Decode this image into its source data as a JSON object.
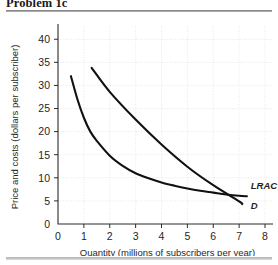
{
  "figure": {
    "title": "Problem 1c"
  },
  "chart_data": {
    "type": "line",
    "title": "Problem 1c",
    "xlabel": "Quantity (millions of subscribers per year)",
    "ylabel": "Price and costs (dollars per subscriber)",
    "xlim": [
      0,
      8
    ],
    "ylim": [
      0,
      42
    ],
    "grid": true,
    "legend_position": "inline-right",
    "x_ticks": [
      0,
      1,
      2,
      3,
      4,
      5,
      6,
      7,
      8
    ],
    "x_tick_labels": [
      "0",
      "1",
      "2",
      "3",
      "4",
      "5",
      "6",
      "7",
      "8"
    ],
    "y_ticks": [
      0,
      5,
      10,
      15,
      20,
      25,
      30,
      35,
      40
    ],
    "y_tick_labels": [
      "0",
      "5",
      "10",
      "15",
      "20",
      "25",
      "30",
      "35",
      "40"
    ],
    "series": [
      {
        "name": "LRAC",
        "label": "LRAC",
        "style": "convex decreasing curve",
        "points": [
          [
            0.5,
            32.0
          ],
          [
            0.75,
            27.0
          ],
          [
            1.0,
            23.0
          ],
          [
            1.25,
            20.0
          ],
          [
            1.5,
            18.0
          ],
          [
            2.0,
            14.8
          ],
          [
            2.5,
            12.6
          ],
          [
            3.0,
            11.0
          ],
          [
            3.5,
            9.9
          ],
          [
            4.0,
            9.0
          ],
          [
            4.5,
            8.3
          ],
          [
            5.0,
            7.7
          ],
          [
            5.5,
            7.2
          ],
          [
            6.0,
            6.8
          ],
          [
            6.5,
            6.4
          ],
          [
            7.0,
            6.1
          ],
          [
            7.3,
            6.0
          ]
        ]
      },
      {
        "name": "D",
        "label": "D",
        "style": "near-linear decreasing demand curve",
        "points": [
          [
            1.3,
            33.8
          ],
          [
            2.0,
            28.6
          ],
          [
            3.0,
            22.6
          ],
          [
            4.0,
            17.2
          ],
          [
            5.0,
            12.4
          ],
          [
            6.0,
            8.4
          ],
          [
            7.0,
            4.9
          ],
          [
            7.12,
            4.3
          ]
        ]
      }
    ],
    "annotations": [
      {
        "text": "LRAC",
        "x": 7.45,
        "y": 7.6
      },
      {
        "text": "D",
        "x": 7.45,
        "y": 3.2
      }
    ]
  }
}
